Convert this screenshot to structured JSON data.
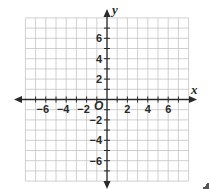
{
  "diagram": {
    "type": "coordinate-plane",
    "x_axis": {
      "name": "x",
      "min": -8,
      "max": 8,
      "tick_step": 1,
      "labels": [
        "−6",
        "−4",
        "−2",
        "2",
        "4",
        "6"
      ],
      "label_values": [
        -6,
        -4,
        -2,
        2,
        4,
        6
      ]
    },
    "y_axis": {
      "name": "y",
      "min": -8,
      "max": 8,
      "tick_step": 1,
      "labels": [
        "6",
        "4",
        "2",
        "−2",
        "−4",
        "−6"
      ],
      "label_values": [
        6,
        4,
        2,
        -2,
        -4,
        -6
      ]
    },
    "origin_label": "O",
    "colors": {
      "grid": "#c4c4c4",
      "axes": "#2a2a2a",
      "background": "#ffffff"
    }
  }
}
